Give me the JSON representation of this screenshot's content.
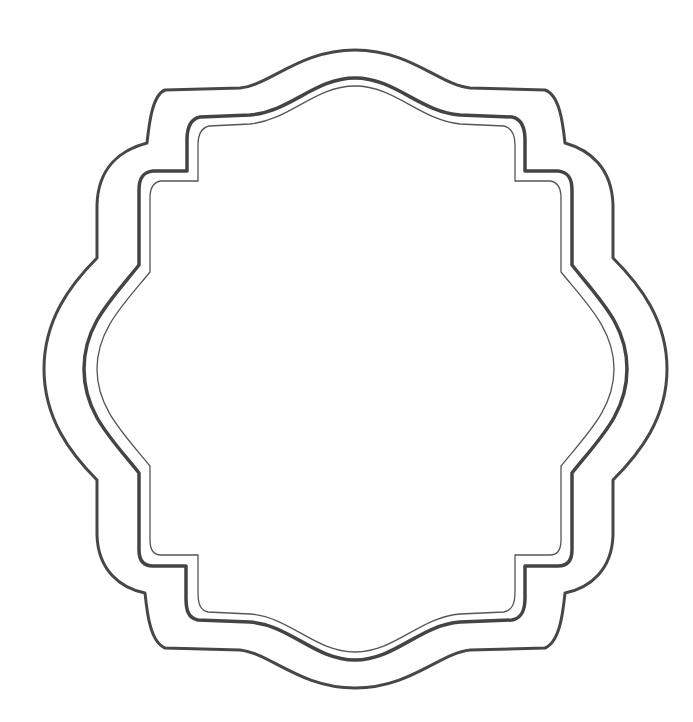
{
  "image": {
    "subject": "decorative ornate frame outline",
    "background": "#ffffff",
    "stroke_color": "#444444",
    "layers": [
      {
        "name": "outer-border",
        "stroke_width": 3
      },
      {
        "name": "middle-border",
        "stroke_width": 3.5
      },
      {
        "name": "inner-border",
        "stroke_width": 1.3
      }
    ]
  }
}
